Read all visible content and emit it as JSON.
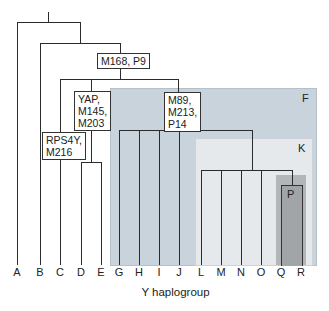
{
  "diagram": {
    "title": "",
    "x_axis_label": "Y haplogroup",
    "leaves": [
      "A",
      "B",
      "C",
      "D",
      "E",
      "G",
      "H",
      "I",
      "J",
      "L",
      "M",
      "N",
      "O",
      "Q",
      "R"
    ],
    "mutation_labels": {
      "m168": "M168, P9",
      "yap": "YAP,\nM145,\nM203",
      "rps4y": "RPS4Y,\nM216",
      "m89": "M89,\nM213,\nP14"
    },
    "regions": {
      "F": {
        "label": "F",
        "color": "#c9d3db"
      },
      "K": {
        "label": "K",
        "color": "#e6e9ec"
      },
      "P": {
        "label": "P",
        "color": "#a2a5a8"
      }
    }
  }
}
